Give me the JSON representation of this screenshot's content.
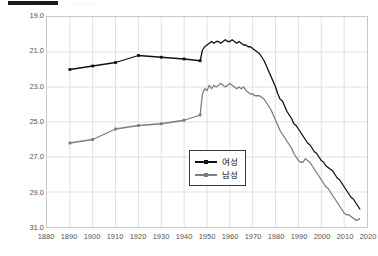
{
  "header": {
    "bar_label": "",
    "ghost_text": "········"
  },
  "chart_data": {
    "type": "line",
    "title": "",
    "xlabel": "",
    "ylabel": "",
    "xlim": [
      1880,
      2020
    ],
    "ylim": [
      19.0,
      31.0
    ],
    "y_inverted": true,
    "grid": true,
    "legend_position": "center-bottom-inside",
    "xticks": [
      1880,
      1890,
      1900,
      1910,
      1920,
      1930,
      1940,
      1950,
      1960,
      1970,
      1980,
      1990,
      2000,
      2010,
      2020
    ],
    "yticks": [
      19.0,
      21.0,
      23.0,
      25.0,
      27.0,
      29.0,
      31.0
    ],
    "ytick_labels": [
      "19.0",
      "21.0",
      "23.0",
      "25.0",
      "27.0",
      "29.0",
      "31.0"
    ],
    "colors": {
      "female": "#111111",
      "male": "#7d7d7d",
      "grid": "#d8d8d8",
      "frame": "#c8c8c8"
    },
    "series": [
      {
        "name": "여성",
        "color": "#111111",
        "marker": "square",
        "x": [
          1890,
          1900,
          1910,
          1920,
          1930,
          1940,
          1947,
          1948,
          1949,
          1950,
          1951,
          1952,
          1953,
          1954,
          1955,
          1956,
          1957,
          1958,
          1959,
          1960,
          1961,
          1962,
          1963,
          1964,
          1965,
          1966,
          1967,
          1968,
          1969,
          1970,
          1971,
          1972,
          1973,
          1974,
          1975,
          1976,
          1977,
          1978,
          1979,
          1980,
          1981,
          1982,
          1983,
          1984,
          1985,
          1986,
          1987,
          1988,
          1989,
          1990,
          1991,
          1992,
          1993,
          1994,
          1995,
          1996,
          1997,
          1998,
          1999,
          2000,
          2001,
          2002,
          2003,
          2004,
          2005,
          2006,
          2007,
          2008,
          2009,
          2010,
          2011,
          2012,
          2013,
          2014,
          2015,
          2016,
          2017
        ],
        "y": [
          22.0,
          21.8,
          21.6,
          21.2,
          21.3,
          21.4,
          21.5,
          20.9,
          20.7,
          20.6,
          20.5,
          20.4,
          20.5,
          20.4,
          20.4,
          20.5,
          20.4,
          20.3,
          20.4,
          20.4,
          20.3,
          20.4,
          20.5,
          20.4,
          20.5,
          20.6,
          20.6,
          20.7,
          20.7,
          20.8,
          20.9,
          21.0,
          21.1,
          21.3,
          21.5,
          21.8,
          22.1,
          22.4,
          22.7,
          23.0,
          23.4,
          23.7,
          23.8,
          24.1,
          24.4,
          24.6,
          24.8,
          25.1,
          25.2,
          25.4,
          25.6,
          25.8,
          26.0,
          26.2,
          26.3,
          26.5,
          26.7,
          26.8,
          27.0,
          27.2,
          27.3,
          27.5,
          27.6,
          27.7,
          27.8,
          28.0,
          28.2,
          28.3,
          28.5,
          28.7,
          28.9,
          29.1,
          29.3,
          29.4,
          29.6,
          29.8,
          30.0
        ]
      },
      {
        "name": "남성",
        "color": "#7d7d7d",
        "marker": "square",
        "x": [
          1890,
          1900,
          1910,
          1920,
          1930,
          1940,
          1947,
          1948,
          1949,
          1950,
          1951,
          1952,
          1953,
          1954,
          1955,
          1956,
          1957,
          1958,
          1959,
          1960,
          1961,
          1962,
          1963,
          1964,
          1965,
          1966,
          1967,
          1968,
          1969,
          1970,
          1971,
          1972,
          1973,
          1974,
          1975,
          1976,
          1977,
          1978,
          1979,
          1980,
          1981,
          1982,
          1983,
          1984,
          1985,
          1986,
          1987,
          1988,
          1989,
          1990,
          1991,
          1992,
          1993,
          1994,
          1995,
          1996,
          1997,
          1998,
          1999,
          2000,
          2001,
          2002,
          2003,
          2004,
          2005,
          2006,
          2007,
          2008,
          2009,
          2010,
          2011,
          2012,
          2013,
          2014,
          2015,
          2016,
          2017
        ],
        "y": [
          26.2,
          26.0,
          25.4,
          25.2,
          25.1,
          24.9,
          24.6,
          23.4,
          23.1,
          23.2,
          22.9,
          23.1,
          22.9,
          23.0,
          22.9,
          22.8,
          22.9,
          23.0,
          22.9,
          22.8,
          22.9,
          23.0,
          23.1,
          23.0,
          23.1,
          23.0,
          23.2,
          23.3,
          23.4,
          23.4,
          23.5,
          23.5,
          23.5,
          23.6,
          23.7,
          23.9,
          24.1,
          24.3,
          24.6,
          24.9,
          25.2,
          25.5,
          25.7,
          25.9,
          26.1,
          26.3,
          26.5,
          26.8,
          27.0,
          27.2,
          27.3,
          27.3,
          27.1,
          27.2,
          27.3,
          27.5,
          27.7,
          27.9,
          28.1,
          28.3,
          28.5,
          28.7,
          28.8,
          29.0,
          29.2,
          29.4,
          29.6,
          29.8,
          30.0,
          30.2,
          30.3,
          30.3,
          30.4,
          30.5,
          30.6,
          30.6,
          30.5
        ]
      }
    ]
  },
  "legend": {
    "items": [
      {
        "label": "여성",
        "color": "#111111"
      },
      {
        "label": "남성",
        "color": "#7d7d7d"
      }
    ]
  }
}
